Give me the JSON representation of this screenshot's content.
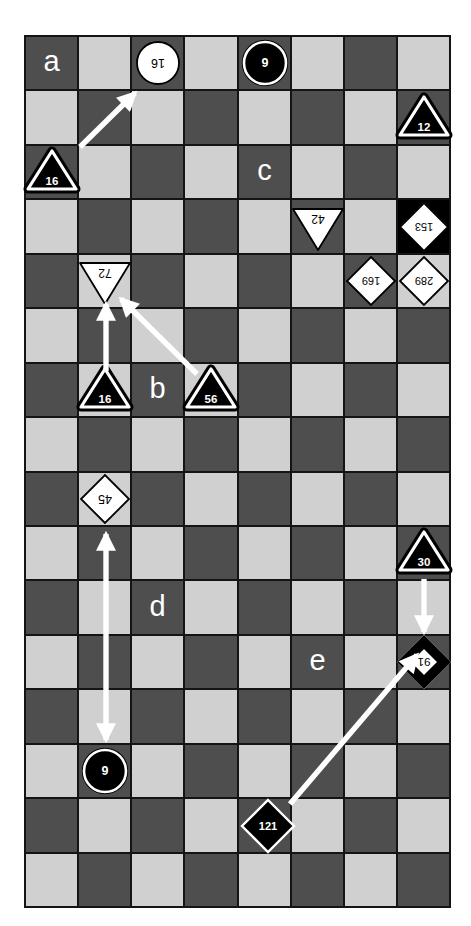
{
  "figure": {
    "background": "#ffffff",
    "width": 471,
    "height": 926
  },
  "board": {
    "x": 24,
    "y": 35,
    "width": 427,
    "height": 873,
    "cols": 8,
    "rows": 16,
    "dark_cell_color": "#4e4e4e",
    "light_cell_color": "#d0d0d0",
    "grid_line_color": "#141414",
    "highlight_cell": {
      "row": 3,
      "col": 7,
      "color": "#000000"
    }
  },
  "label_style": {
    "color": "#ffffff"
  },
  "region_labels": [
    {
      "text": "a",
      "row": 0,
      "col": 0
    },
    {
      "text": "c",
      "row": 2,
      "col": 4
    },
    {
      "text": "b",
      "row": 6,
      "col": 2
    },
    {
      "text": "d",
      "row": 10,
      "col": 2
    },
    {
      "text": "e",
      "row": 11,
      "col": 5
    }
  ],
  "pieces": [
    {
      "shape": "circle",
      "variant": "white",
      "label": "16",
      "flipped": true,
      "row": 0,
      "col": 2,
      "dx": 0
    },
    {
      "shape": "circle",
      "variant": "black",
      "label": "9",
      "flipped": false,
      "row": 0,
      "col": 4,
      "dx": 0
    },
    {
      "shape": "triangle",
      "variant": "black",
      "label": "12",
      "flipped": false,
      "row": 1,
      "col": 7,
      "dx": 0
    },
    {
      "shape": "triangle",
      "variant": "black",
      "label": "16",
      "flipped": false,
      "row": 2,
      "col": 0,
      "dx": 0
    },
    {
      "shape": "triangle",
      "variant": "white",
      "label": "42",
      "flipped": true,
      "row": 3,
      "col": 5,
      "dx": 0
    },
    {
      "shape": "diamond",
      "variant": "white",
      "label": "153",
      "flipped": true,
      "row": 3,
      "col": 7,
      "dx": 0
    },
    {
      "shape": "triangle",
      "variant": "white",
      "label": "72",
      "flipped": true,
      "row": 4,
      "col": 1,
      "dx": 0
    },
    {
      "shape": "diamond",
      "variant": "white",
      "label": "169",
      "flipped": true,
      "row": 4,
      "col": 6,
      "dx": 0
    },
    {
      "shape": "diamond",
      "variant": "white",
      "label": "289",
      "flipped": true,
      "row": 4,
      "col": 7,
      "dx": 0
    },
    {
      "shape": "triangle",
      "variant": "black",
      "label": "16",
      "flipped": false,
      "row": 6,
      "col": 1,
      "dx": 0
    },
    {
      "shape": "triangle",
      "variant": "black",
      "label": "56",
      "flipped": false,
      "row": 6,
      "col": 3,
      "dx": 0
    },
    {
      "shape": "diamond",
      "variant": "white",
      "label": "45",
      "flipped": true,
      "row": 8,
      "col": 1,
      "dx": 0
    },
    {
      "shape": "triangle",
      "variant": "black",
      "label": "30",
      "flipped": false,
      "row": 9,
      "col": 7,
      "dx": 0
    },
    {
      "shape": "diamond",
      "variant": "thick_border",
      "label": "91",
      "flipped": true,
      "row": 11,
      "col": 7,
      "dx": 0
    },
    {
      "shape": "circle",
      "variant": "black",
      "label": "9",
      "flipped": false,
      "row": 13,
      "col": 1,
      "dx": 0
    },
    {
      "shape": "diamond",
      "variant": "black",
      "label": "121",
      "flipped": false,
      "row": 14,
      "col": 4,
      "dx": 3
    }
  ],
  "arrows": {
    "color": "#ffffff",
    "items": [
      {
        "x1": 80,
        "y1": 147,
        "x2": 135,
        "y2": 93,
        "double_headed": false
      },
      {
        "x1": 106,
        "y1": 371,
        "x2": 106,
        "y2": 304,
        "double_headed": false
      },
      {
        "x1": 197,
        "y1": 374,
        "x2": 121,
        "y2": 299,
        "double_headed": false
      },
      {
        "x1": 106,
        "y1": 534,
        "x2": 106,
        "y2": 740,
        "double_headed": true
      },
      {
        "x1": 424,
        "y1": 579,
        "x2": 424,
        "y2": 632,
        "double_headed": false
      },
      {
        "x1": 290,
        "y1": 804,
        "x2": 417,
        "y2": 655,
        "double_headed": false
      }
    ]
  }
}
